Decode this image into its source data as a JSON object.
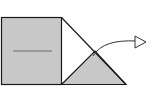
{
  "diagram": {
    "colors": {
      "fill": "#c8c8c8",
      "stroke": "#1a1a1a",
      "background": "#ffffff",
      "crease": "#6a6a6a"
    },
    "shapes": {
      "square": {
        "x": 1,
        "y": 17,
        "width": 60,
        "height": 68
      },
      "crease_line": {
        "x1": 13,
        "y1": 51,
        "x2": 52,
        "y2": 51
      },
      "fold_line": {
        "x1": 61,
        "y1": 17,
        "x2": 126,
        "y2": 84
      },
      "triangle_flap": {
        "points": "61,84 95,51 126,84"
      },
      "arrow": {
        "start": [
          93,
          56
        ],
        "end": [
          136,
          42
        ],
        "head": "open-triangle"
      }
    }
  }
}
